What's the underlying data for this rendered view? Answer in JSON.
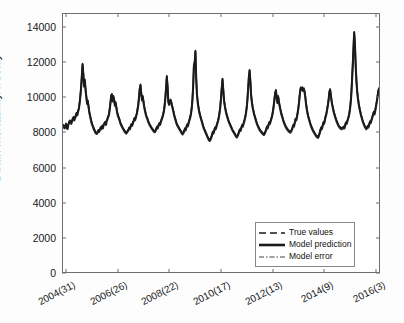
{
  "chart_data": {
    "type": "line",
    "title": "",
    "xlabel": "",
    "ylabel": "Death Mortability/weekly",
    "ylim": [
      0,
      14800
    ],
    "yticks": [
      0,
      2000,
      4000,
      6000,
      8000,
      10000,
      12000,
      14000
    ],
    "ytick_labels": [
      "0",
      "2000",
      "4000",
      "6000",
      "8000",
      "10000",
      "12000",
      "14000"
    ],
    "xtick_labels": [
      "2004(31)",
      "2006(26)",
      "2008(22)",
      "2010(17)",
      "2012(13)",
      "2014(9)",
      "2016(3)"
    ],
    "xtick_positions": [
      0.012,
      0.175,
      0.337,
      0.5,
      0.662,
      0.825,
      0.988
    ],
    "grid": false,
    "legend_position": "lower right",
    "series": [
      {
        "name": "True values",
        "style": "dashed",
        "color": "#2b2b2b",
        "values": [
          8450,
          8380,
          8300,
          8420,
          8520,
          8300,
          8260,
          8480,
          8600,
          8700,
          8640,
          8560,
          8700,
          8820,
          8900,
          8760,
          8880,
          9000,
          9150,
          9050,
          9250,
          9400,
          9700,
          10100,
          10600,
          11250,
          11950,
          11400,
          10700,
          11050,
          10500,
          10100,
          9700,
          9850,
          9500,
          9200,
          9000,
          8800,
          8600,
          8480,
          8350,
          8250,
          8150,
          8050,
          8000,
          7980,
          8050,
          8150,
          8100,
          8200,
          8320,
          8250,
          8400,
          8300,
          8480,
          8550,
          8620,
          8500,
          8700,
          8800,
          8950,
          9050,
          9350,
          9700,
          10150,
          10220,
          9850,
          10100,
          9900,
          9600,
          9750,
          9450,
          9200,
          9000,
          8900,
          8780,
          8620,
          8500,
          8420,
          8330,
          8250,
          8180,
          8100,
          8050,
          8000,
          8050,
          8120,
          8200,
          8300,
          8250,
          8400,
          8500,
          8450,
          8600,
          8700,
          8850,
          8780,
          8950,
          9100,
          9350,
          9600,
          10050,
          10550,
          10760,
          10300,
          9900,
          10100,
          9800,
          9500,
          9300,
          9100,
          8950,
          8850,
          8700,
          8600,
          8500,
          8420,
          8350,
          8280,
          8220,
          8150,
          8100,
          8080,
          8150,
          8250,
          8350,
          8300,
          8450,
          8550,
          8500,
          8650,
          8780,
          8900,
          9050,
          9250,
          9550,
          10000,
          10600,
          11250,
          10650,
          9800,
          9650,
          9800,
          9900,
          9750,
          9550,
          9400,
          9200,
          9000,
          8850,
          8700,
          8550,
          8450,
          8380,
          8300,
          8220,
          8150,
          8080,
          8000,
          7950,
          8020,
          8120,
          8250,
          8180,
          8350,
          8480,
          8420,
          8600,
          8750,
          8900,
          9100,
          9400,
          9900,
          10700,
          11900,
          12050,
          12700,
          11200,
          10250,
          9800,
          9500,
          9250,
          9050,
          8900,
          8750,
          8600,
          8450,
          8300,
          8200,
          8100,
          8000,
          7900,
          7800,
          7700,
          7620,
          7580,
          7650,
          7750,
          7900,
          8050,
          8000,
          8150,
          8300,
          8250,
          8400,
          8550,
          8700,
          8900,
          9150,
          9500,
          10000,
          10600,
          11100,
          10500,
          9900,
          9600,
          9350,
          9150,
          9000,
          8850,
          8700,
          8600,
          8500,
          8400,
          8300,
          8200,
          8120,
          8050,
          7980,
          7900,
          7820,
          7780,
          7850,
          7950,
          8080,
          8200,
          8150,
          8300,
          8450,
          8400,
          8550,
          8700,
          8880,
          9100,
          9400,
          9850,
          10500,
          11200,
          11600,
          11000,
          10200,
          9800,
          9500,
          9300,
          9100,
          8950,
          8800,
          8650,
          8520,
          8420,
          8320,
          8230,
          8160,
          8100,
          8050,
          8000,
          7950,
          7920,
          7980,
          8080,
          8200,
          8350,
          8300,
          8450,
          8600,
          8550,
          8700,
          8850,
          9000,
          9250,
          9550,
          9950,
          10300,
          10450,
          10050,
          9750,
          10100,
          9800,
          9550,
          9350,
          9150,
          9000,
          8850,
          8700,
          8580,
          8470,
          8380,
          8300,
          8230,
          8180,
          8120,
          8080,
          8050,
          8100,
          8180,
          8300,
          8450,
          8400,
          8600,
          8800,
          8750,
          8950,
          9200,
          9500,
          9900,
          10350,
          10600,
          10500,
          10600,
          10450,
          10550,
          10400,
          10100,
          9700,
          9400,
          9150,
          8950,
          8800,
          8650,
          8500,
          8380,
          8280,
          8180,
          8100,
          8020,
          7950,
          7880,
          7820,
          7780,
          7760,
          7850,
          7980,
          8150,
          8300,
          8250,
          8420,
          8600,
          8550,
          8750,
          8950,
          9100,
          9350,
          9600,
          9900,
          10350,
          10500,
          10200,
          9850,
          9600,
          9400,
          9200,
          9050,
          8900,
          8780,
          8650,
          8550,
          8450,
          8380,
          8320,
          8280,
          8250,
          8300,
          8280,
          8350,
          8300,
          8450,
          8600,
          8550,
          8700,
          8850,
          9000,
          9250,
          9600,
          10100,
          10900,
          11800,
          12800,
          13780,
          13100,
          11900,
          11000,
          10400,
          10000,
          9700,
          9450,
          9250,
          9050,
          8900,
          8750,
          8620,
          8500,
          8400,
          8320,
          8250,
          8300,
          8400,
          8350,
          8500,
          8650,
          8600,
          8750,
          8900,
          9050,
          9200,
          9100,
          9300,
          9550,
          9800,
          10100,
          10400,
          10550
        ]
      },
      {
        "name": "Model prediction",
        "style": "solid",
        "color": "#1a1a1a"
      },
      {
        "name": "Model error",
        "style": "dashdot",
        "color": "#7a7a7a"
      }
    ]
  },
  "legend": {
    "items": [
      {
        "label": "True values",
        "style": "dashed"
      },
      {
        "label": "Model prediction",
        "style": "solid"
      },
      {
        "label": "Model error",
        "style": "dashdot"
      }
    ]
  },
  "axes": {
    "y_label": "Death Mortability/weekly"
  }
}
